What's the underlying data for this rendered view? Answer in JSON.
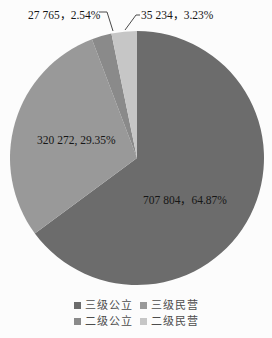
{
  "chart_data": {
    "type": "pie",
    "title": "",
    "start_angle_deg": 0,
    "direction": "clockwise",
    "legend_position": "bottom",
    "background_color": "#fcfcfc",
    "label_text_color": "#161616",
    "leader_line_color": "#4a4a4a",
    "slices": [
      {
        "label": "三级公立",
        "value": 707804,
        "percent": 64.87,
        "display": "707 804，64.87%",
        "color": "#6c6c6c"
      },
      {
        "label": "三级民营",
        "value": 320272,
        "percent": 29.35,
        "display": "320 272, 29.35%",
        "color": "#999999"
      },
      {
        "label": "二级公立",
        "value": 27765,
        "percent": 2.54,
        "display": "27 765，2.54%",
        "color": "#8a8a8a"
      },
      {
        "label": "二级民营",
        "value": 35234,
        "percent": 3.23,
        "display": "35 234，3.23%",
        "color": "#c6c6c6"
      }
    ]
  }
}
